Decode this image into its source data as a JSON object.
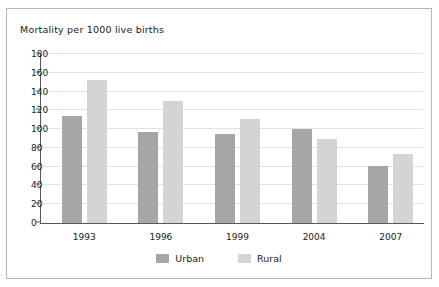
{
  "chart_data": {
    "type": "bar",
    "title": "Mortality per 1000 live births",
    "xlabel": "",
    "ylabel": "",
    "ylim": [
      0,
      180
    ],
    "yticks": [
      0,
      20,
      40,
      60,
      80,
      100,
      120,
      140,
      160,
      180
    ],
    "grid": true,
    "legend_position": "bottom",
    "categories": [
      "1993",
      "1996",
      "1999",
      "2004",
      "2007"
    ],
    "series": [
      {
        "name": "Urban",
        "color": "#a6a6a6",
        "values": [
          114,
          97,
          95,
          100,
          61
        ]
      },
      {
        "name": "Rural",
        "color": "#d4d4d4",
        "values": [
          152,
          130,
          111,
          89,
          73
        ]
      }
    ]
  },
  "legend": {
    "entries": [
      {
        "label": "Urban",
        "color": "#a6a6a6"
      },
      {
        "label": "Rural",
        "color": "#d4d4d4"
      }
    ]
  },
  "colors": {
    "urban": "#a6a6a6",
    "rural": "#d4d4d4",
    "axis": "#58585a",
    "grid": "#e2e2e2",
    "border": "#b8b8b8",
    "text": "#1a1a1a"
  }
}
